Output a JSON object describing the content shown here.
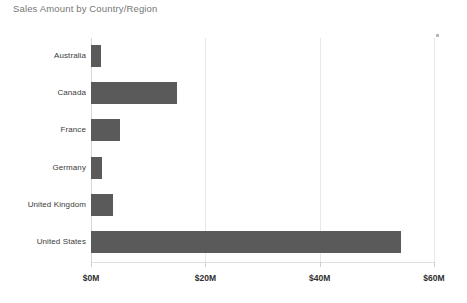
{
  "chart_data": {
    "type": "bar",
    "orientation": "horizontal",
    "title": "Sales Amount by Country/Region",
    "xlabel": "",
    "ylabel": "",
    "categories": [
      "Australia",
      "Canada",
      "France",
      "Germany",
      "United Kingdom",
      "United States"
    ],
    "values": [
      1.8,
      15.0,
      5.1,
      1.9,
      3.9,
      54.2
    ],
    "value_unit": "$M",
    "xlim": [
      0,
      60
    ],
    "xticks": [
      0,
      20,
      40,
      60
    ],
    "xtick_labels": [
      "$0M",
      "$20M",
      "$40M",
      "$60M"
    ],
    "grid": true,
    "legend": false,
    "bar_color": "#5a5a5a",
    "gridline_color": "#e8e8e8",
    "title_color": "#767676",
    "label_color": "#3b3b3b",
    "background_color": "#ffffff"
  }
}
